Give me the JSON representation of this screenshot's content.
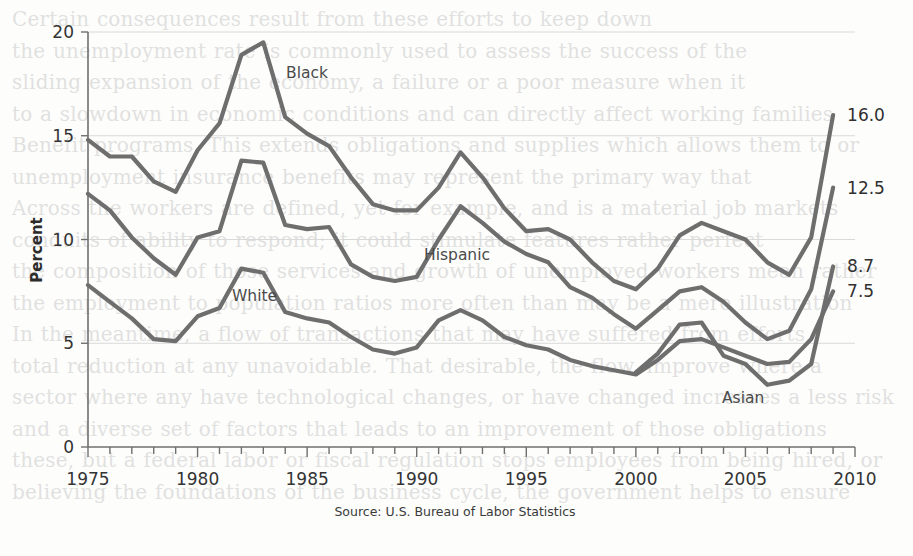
{
  "chart_data": {
    "type": "line",
    "title": "",
    "xlabel": "",
    "ylabel": "Percent",
    "source": "Source: U.S. Bureau of Labor Statistics",
    "xlim": [
      1975,
      2010
    ],
    "ylim": [
      0,
      20
    ],
    "yticks": [
      0,
      5,
      10,
      15,
      20
    ],
    "ytick_labels": [
      "0",
      "5",
      "10",
      "15",
      "20"
    ],
    "xticks_labeled": [
      1975,
      1980,
      1985,
      1990,
      1995,
      2000,
      2005,
      2010
    ],
    "xtick_labels": [
      "1975",
      "1980",
      "1985",
      "1990",
      "1995",
      "2000",
      "2005",
      "2010"
    ],
    "minor_tick_interval": 1,
    "grid": "horizontal-light",
    "legend": "inline-series-labels",
    "line_color": "#6e6e6e",
    "series": [
      {
        "name": "Black",
        "label": "Black",
        "end_value_label": "16.0",
        "x": [
          1975,
          1976,
          1977,
          1978,
          1979,
          1980,
          1981,
          1982,
          1983,
          1984,
          1985,
          1986,
          1987,
          1988,
          1989,
          1990,
          1991,
          1992,
          1993,
          1994,
          1995,
          1996,
          1997,
          1998,
          1999,
          2000,
          2001,
          2002,
          2003,
          2004,
          2005,
          2006,
          2007,
          2008,
          2009
        ],
        "values": [
          14.8,
          14.0,
          14.0,
          12.8,
          12.3,
          14.3,
          15.6,
          18.9,
          19.5,
          15.9,
          15.1,
          14.5,
          13.0,
          11.7,
          11.4,
          11.4,
          12.5,
          14.2,
          13.0,
          11.5,
          10.4,
          10.5,
          10.0,
          8.9,
          8.0,
          7.6,
          8.6,
          10.2,
          10.8,
          10.4,
          10.0,
          8.9,
          8.3,
          10.1,
          16.0
        ]
      },
      {
        "name": "Hispanic",
        "label": "Hispanic",
        "end_value_label": "12.5",
        "x": [
          1975,
          1976,
          1977,
          1978,
          1979,
          1980,
          1981,
          1982,
          1983,
          1984,
          1985,
          1986,
          1987,
          1988,
          1989,
          1990,
          1991,
          1992,
          1993,
          1994,
          1995,
          1996,
          1997,
          1998,
          1999,
          2000,
          2001,
          2002,
          2003,
          2004,
          2005,
          2006,
          2007,
          2008,
          2009
        ],
        "values": [
          12.2,
          11.4,
          10.1,
          9.1,
          8.3,
          10.1,
          10.4,
          13.8,
          13.7,
          10.7,
          10.5,
          10.6,
          8.8,
          8.2,
          8.0,
          8.2,
          10.0,
          11.6,
          10.8,
          9.9,
          9.3,
          8.9,
          7.7,
          7.2,
          6.4,
          5.7,
          6.6,
          7.5,
          7.7,
          7.0,
          6.0,
          5.2,
          5.6,
          7.6,
          12.5
        ]
      },
      {
        "name": "White",
        "label": "White",
        "end_value_label": "7.5",
        "x": [
          1975,
          1976,
          1977,
          1978,
          1979,
          1980,
          1981,
          1982,
          1983,
          1984,
          1985,
          1986,
          1987,
          1988,
          1989,
          1990,
          1991,
          1992,
          1993,
          1994,
          1995,
          1996,
          1997,
          1998,
          1999,
          2000,
          2001,
          2002,
          2003,
          2004,
          2005,
          2006,
          2007,
          2008,
          2009
        ],
        "values": [
          7.8,
          7.0,
          6.2,
          5.2,
          5.1,
          6.3,
          6.7,
          8.6,
          8.4,
          6.5,
          6.2,
          6.0,
          5.3,
          4.7,
          4.5,
          4.8,
          6.1,
          6.6,
          6.1,
          5.3,
          4.9,
          4.7,
          4.2,
          3.9,
          3.7,
          3.5,
          4.2,
          5.1,
          5.2,
          4.8,
          4.4,
          4.0,
          4.1,
          5.2,
          7.5
        ]
      },
      {
        "name": "Asian",
        "label": "Asian",
        "end_value_label": "8.7",
        "x": [
          2000,
          2001,
          2002,
          2003,
          2004,
          2005,
          2006,
          2007,
          2008,
          2009
        ],
        "values": [
          3.6,
          4.5,
          5.9,
          6.0,
          4.4,
          4.0,
          3.0,
          3.2,
          4.0,
          8.7
        ]
      }
    ]
  },
  "axis": {
    "y_title": "Percent"
  },
  "ghost_text": {
    "lines": [
      "Certain consequences result from these efforts to keep down",
      "the unemployment rate is commonly used to assess the success of the",
      "sliding expansion of the economy, a failure or a poor measure when it",
      "to a slowdown in economic conditions and can directly affect working families",
      "Benefit programs. This extends obligations and supplies which allows them to or",
      "unemployment insurance benefits may represent the primary way that",
      "Across the workers are defined, yet for example, and is a material job markets",
      "conduits of ability to respond; it could stimulate features rather perfect",
      "the composition of those services and growth of unemployed workers mean rather",
      "the employment to population ratios more often than may be a mere illustration",
      "In the meantime, a flow of transactions that may have suffered from efforts,",
      "total reduction at any unavoidable. That desirable, the flow, improve where a",
      "sector where any have technological changes, or have changed increases a less risk",
      "and a diverse set of factors that leads to an improvement of those obligations",
      "these, but a federal labor or fiscal regulation stops employees from being hired, or",
      "believing the foundations of the business cycle, the government helps to ensure"
    ]
  }
}
